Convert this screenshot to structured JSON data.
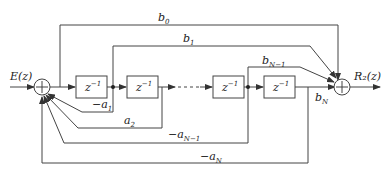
{
  "diagram": {
    "type": "signal-flow block diagram (IIR direct form)",
    "input_label": "E(z)",
    "output_label": "R₂(z)",
    "delay_blocks": [
      {
        "label": "z",
        "exp": "−1"
      },
      {
        "label": "z",
        "exp": "−1"
      },
      {
        "label": "z",
        "exp": "−1"
      },
      {
        "label": "z",
        "exp": "−1"
      }
    ],
    "ellipsis": "· · ·",
    "summing_junction_symbol": "+",
    "feedforward": {
      "b0": {
        "base": "b",
        "sub": "0"
      },
      "b1": {
        "base": "b",
        "sub": "1"
      },
      "bN1": {
        "base": "b",
        "sub": "N−1"
      },
      "bN": {
        "base": "b",
        "sub": "N"
      }
    },
    "feedback": {
      "a1": {
        "base": "−a",
        "sub": "1"
      },
      "a2": {
        "base": "a",
        "sub": "2"
      },
      "aN1": {
        "base": "−a",
        "sub": "N−1"
      },
      "aN": {
        "base": "−a",
        "sub": "N"
      }
    }
  }
}
